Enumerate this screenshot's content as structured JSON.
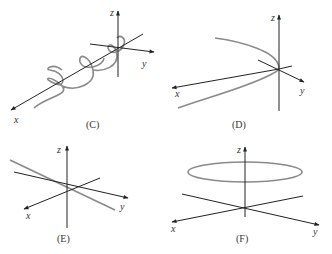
{
  "figure": {
    "panels": [
      {
        "id": "C",
        "caption": "(C)",
        "description": "Helix wrapped around the x-axis",
        "axis_labels": {
          "x": "x",
          "y": "y",
          "z": "z"
        }
      },
      {
        "id": "D",
        "caption": "(D)",
        "description": "Parabola-like curve opening in the negative-y direction, vertex at origin",
        "axis_labels": {
          "x": "x",
          "y": "y",
          "z": "z"
        }
      },
      {
        "id": "E",
        "caption": "(E)",
        "description": "Straight line through origin",
        "axis_labels": {
          "x": "x",
          "y": "y",
          "z": "z"
        }
      },
      {
        "id": "F",
        "caption": "(F)",
        "description": "Horizontal circle above the xy-plane centered on z-axis",
        "axis_labels": {
          "x": "x",
          "y": "y",
          "z": "z"
        }
      }
    ],
    "colors": {
      "axis": "#222222",
      "curve": "#8a8a8a",
      "text": "#333333",
      "background": "#ffffff"
    }
  }
}
